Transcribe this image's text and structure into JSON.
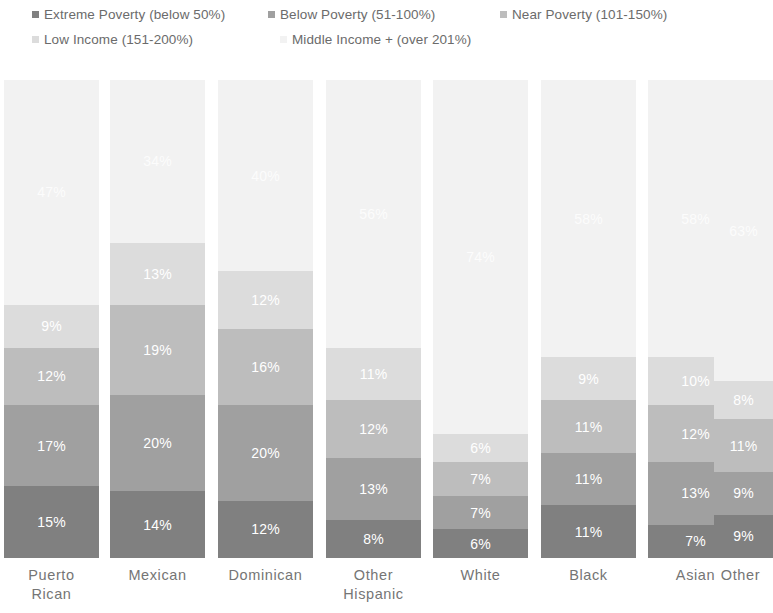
{
  "legend": {
    "items": [
      {
        "label": "Extreme Poverty (below 50%)",
        "color": "#808080"
      },
      {
        "label": "Below Poverty (51-100%)",
        "color": "#a0a0a0"
      },
      {
        "label": "Near Poverty (101-150%)",
        "color": "#bdbdbd"
      },
      {
        "label": "Low Income (151-200%)",
        "color": "#dcdcdc"
      },
      {
        "label": "Middle Income + (over 201%)",
        "color": "#f2f2f2"
      }
    ]
  },
  "chart_data": {
    "type": "bar",
    "stacked": true,
    "title": "",
    "subtitle": "",
    "xlabel": "",
    "ylabel": "",
    "ylim": [
      0,
      100
    ],
    "grid": false,
    "legend_position": "top",
    "value_suffix": "%",
    "categories": [
      "Puerto Rican",
      "Mexican",
      "Dominican",
      "Other Hispanic",
      "White",
      "Black",
      "Asian",
      "Other"
    ],
    "category_lines": [
      [
        "Puerto",
        "Rican"
      ],
      [
        "Mexican"
      ],
      [
        "Dominican"
      ],
      [
        "Other",
        "Hispanic"
      ],
      [
        "White"
      ],
      [
        "Black"
      ],
      [
        "Asian"
      ],
      [
        "Other"
      ]
    ],
    "series": [
      {
        "name": "Extreme Poverty (below 50%)",
        "color": "#808080",
        "values": [
          15,
          14,
          12,
          8,
          6,
          11,
          7,
          9
        ],
        "labels": [
          "15%",
          "14%",
          "12%",
          "8%",
          "6%",
          "11%",
          "7%",
          "9%"
        ]
      },
      {
        "name": "Below Poverty (51-100%)",
        "color": "#a0a0a0",
        "values": [
          17,
          20,
          20,
          13,
          7,
          11,
          13,
          9
        ],
        "labels": [
          "17%",
          "20%",
          "20%",
          "13%",
          "7%",
          "11%",
          "13%",
          "9%"
        ]
      },
      {
        "name": "Near Poverty (101-150%)",
        "color": "#bdbdbd",
        "values": [
          12,
          19,
          16,
          12,
          7,
          11,
          12,
          11
        ],
        "labels": [
          "12%",
          "19%",
          "16%",
          "12%",
          "7%",
          "11%",
          "12%",
          "11%"
        ]
      },
      {
        "name": "Low Income (151-200%)",
        "color": "#dcdcdc",
        "values": [
          9,
          13,
          12,
          11,
          6,
          9,
          10,
          8
        ],
        "labels": [
          "9%",
          "13%",
          "12%",
          "11%",
          "6%",
          "9%",
          "10%",
          "8%"
        ]
      },
      {
        "name": "Middle Income + (over 201%)",
        "color": "#f2f2f2",
        "values": [
          47,
          34,
          40,
          56,
          74,
          58,
          58,
          63
        ],
        "labels": [
          "47%",
          "34%",
          "40%",
          "56%",
          "74%",
          "58%",
          "58%",
          "63%"
        ]
      }
    ]
  },
  "layout": {
    "bar_left_px": [
      4,
      110,
      218,
      326,
      433,
      541,
      648,
      714
    ],
    "bar_width_px": [
      95,
      95,
      95,
      95,
      95,
      95,
      95,
      59
    ],
    "tick_left_px": [
      0,
      104,
      212,
      320,
      427,
      535,
      642,
      708
    ],
    "tick_width_px": [
      103,
      107,
      107,
      107,
      107,
      107,
      107,
      65
    ]
  }
}
